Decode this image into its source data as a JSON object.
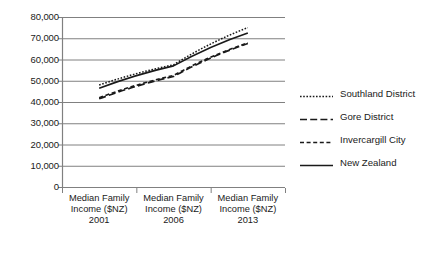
{
  "chart_data": {
    "type": "line",
    "title": "",
    "xlabel": "",
    "ylabel": "",
    "categories": [
      "Median Family Income ($NZ) 2001",
      "Median Family Income ($NZ) 2006",
      "Median Family Income ($NZ) 2013"
    ],
    "category_lines": [
      [
        "Median Family",
        "Income ($NZ)",
        "2001"
      ],
      [
        "Median Family",
        "Income ($NZ)",
        "2006"
      ],
      [
        "Median Family",
        "Income ($NZ)",
        "2013"
      ]
    ],
    "x": [
      2001,
      2006,
      2013
    ],
    "ylim": [
      0,
      80000
    ],
    "ytick_values": [
      0,
      10000,
      20000,
      30000,
      40000,
      50000,
      60000,
      70000,
      80000
    ],
    "ytick_labels": [
      "0",
      "10,000",
      "20,000",
      "30,000",
      "40,000",
      "50,000",
      "60,000",
      "70,000",
      "80,000"
    ],
    "grid": true,
    "legend_position": "right",
    "series": [
      {
        "name": "Southland District",
        "values": [
          48000,
          57500,
          75000
        ],
        "style": "dotted",
        "color": "#1a1a1a"
      },
      {
        "name": "Gore District",
        "values": [
          41500,
          52000,
          67500
        ],
        "style": "long-dashed",
        "color": "#1a1a1a"
      },
      {
        "name": "Invercargill City",
        "values": [
          42000,
          52500,
          67800
        ],
        "style": "short-dashed",
        "color": "#1a1a1a"
      },
      {
        "name": "New Zealand",
        "values": [
          46500,
          57000,
          72500
        ],
        "style": "solid",
        "color": "#1a1a1a"
      }
    ]
  },
  "axes": {
    "gridline_color": "#808080",
    "axis_color": "#808080",
    "background": "#ffffff"
  },
  "legend": {
    "entries": [
      {
        "label": "Southland District",
        "style": "dotted"
      },
      {
        "label": "Gore District",
        "style": "long-dashed"
      },
      {
        "label": "Invercargill City",
        "style": "short-dashed"
      },
      {
        "label": "New Zealand",
        "style": "solid"
      }
    ]
  }
}
